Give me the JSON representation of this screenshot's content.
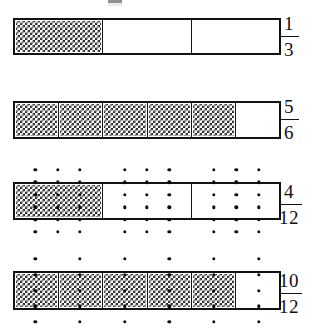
{
  "figure": {
    "background_color": "#ffffff",
    "line_color": "#121212",
    "shading_color": "#2b2b2b",
    "dot_color": "#0b0b0b",
    "rows": [
      {
        "id": "row-1",
        "fraction": {
          "numerator": "1",
          "denominator": "3"
        },
        "segments_total": 3,
        "segments_shaded": 1,
        "bar": {
          "x": 13,
          "y": 18,
          "width": 268,
          "height": 37
        },
        "label": {
          "y": 14
        },
        "dots": {
          "present": false,
          "columns": 0,
          "rows": 0
        }
      },
      {
        "id": "row-2",
        "fraction": {
          "numerator": "5",
          "denominator": "6"
        },
        "segments_total": 6,
        "segments_shaded": 5,
        "bar": {
          "x": 13,
          "y": 101,
          "width": 268,
          "height": 38
        },
        "label": {
          "y": 97
        },
        "dots": {
          "present": false,
          "columns": 0,
          "rows": 0
        }
      },
      {
        "id": "row-3",
        "fraction": {
          "numerator": "4",
          "denominator": "12"
        },
        "segments_total": 3,
        "segments_shaded": 1,
        "bar": {
          "x": 13,
          "y": 182,
          "width": 268,
          "height": 38
        },
        "label": {
          "y": 182
        },
        "dots": {
          "present": true,
          "columns": 9,
          "rows": 6,
          "subdivision": 4
        }
      },
      {
        "id": "row-4",
        "fraction": {
          "numerator": "10",
          "denominator": "12"
        },
        "segments_total": 6,
        "segments_shaded": 5,
        "bar": {
          "x": 13,
          "y": 271,
          "width": 268,
          "height": 39
        },
        "label": {
          "y": 271
        },
        "dots": {
          "present": true,
          "columns": 6,
          "rows": 5,
          "subdivision": 2
        }
      }
    ]
  },
  "chart_data": {
    "type": "bar",
    "xlabel": "",
    "ylabel": "",
    "categories": [
      "1/3",
      "5/6",
      "4/12",
      "10/12"
    ],
    "values": [
      0.3333,
      0.8333,
      0.3333,
      0.8333
    ],
    "series": [
      {
        "name": "shaded parts",
        "values": [
          1,
          5,
          4,
          10
        ]
      },
      {
        "name": "total parts",
        "values": [
          3,
          6,
          12,
          12
        ]
      }
    ],
    "annotations": [
      "Bar 1: 3 equal parts, 1 shaded -> 1/3",
      "Bar 2: 6 equal parts, 5 shaded -> 5/6",
      "Bar 3: 3 equal parts with dot grid splitting each into 4 -> 4/12",
      "Bar 4: 6 equal parts with dot grid splitting each into 2 -> 10/12"
    ],
    "grid": false,
    "legend": "none"
  }
}
